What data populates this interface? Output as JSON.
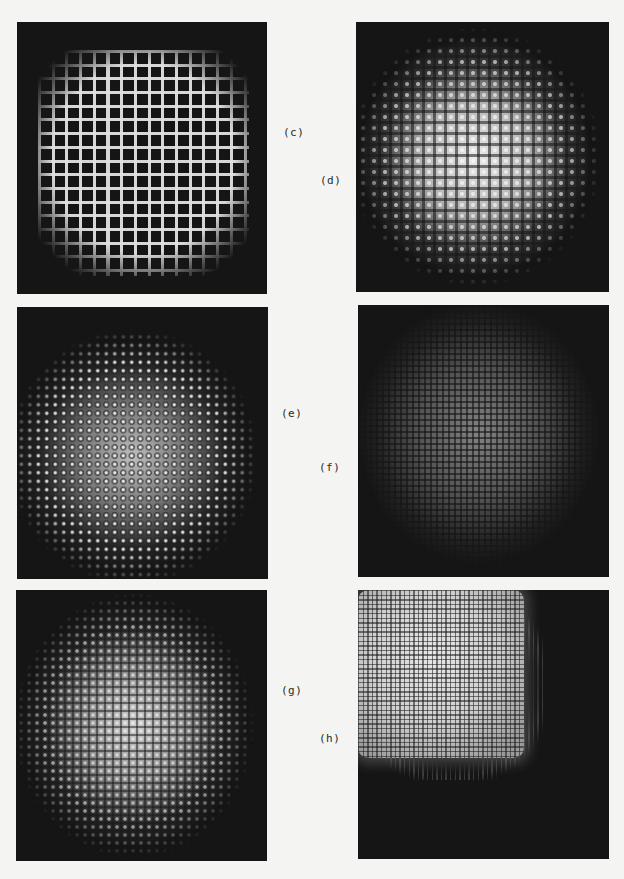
{
  "figure": {
    "panels": [
      {
        "id": "c",
        "label": "(c)",
        "pattern": "coarse bright square grid",
        "pitch_px": 13.7
      },
      {
        "id": "d",
        "label": "(d)",
        "pattern": "bright circular disc with lattice",
        "pitch_px": 11
      },
      {
        "id": "e",
        "label": "(e)",
        "pattern": "circular glow with ring dots",
        "pitch_px": 8.5
      },
      {
        "id": "f",
        "label": "(f)",
        "pattern": "dim fine grid",
        "pitch_px": 6
      },
      {
        "id": "g",
        "label": "(g)",
        "pattern": "circular glow with dot grid",
        "pitch_px": 8
      },
      {
        "id": "h",
        "label": "(h)",
        "pattern": "bright rounded square with very fine grid",
        "pitch_px": 4.6
      }
    ]
  },
  "colors": {
    "page_background": "#f4f4f2",
    "panel_background": "#151515",
    "label_text": "#2a2a2a"
  }
}
